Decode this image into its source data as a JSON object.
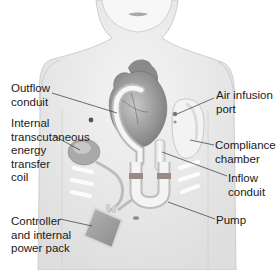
{
  "diagram": {
    "labels": [
      {
        "id": "outflow-conduit",
        "text": "Outflow\nconduit",
        "x": 11,
        "y": 82
      },
      {
        "id": "internal-tet-coil",
        "text": "Internal\ntranscutaneous\nenergy\ntransfer\ncoil",
        "x": 11,
        "y": 117
      },
      {
        "id": "controller-power-pack",
        "text": "Controller\nand internal\npower pack",
        "x": 11,
        "y": 215
      },
      {
        "id": "air-infusion-port",
        "text": "Air infusion\nport",
        "x": 216,
        "y": 89
      },
      {
        "id": "compliance-chamber",
        "text": "Compliance\nchamber",
        "x": 215,
        "y": 139
      },
      {
        "id": "inflow-conduit",
        "text": "Inflow\nconduit",
        "x": 228,
        "y": 172
      },
      {
        "id": "pump",
        "text": "Pump",
        "x": 216,
        "y": 214
      }
    ],
    "colors": {
      "skin": "#ececec",
      "skin_shadow": "#d6d6d6",
      "heart": "#8f8f8f",
      "device": "#f2f2f2",
      "band": "#9a8a86",
      "leader_line": "#333333",
      "text": "#1a1a1a"
    }
  }
}
